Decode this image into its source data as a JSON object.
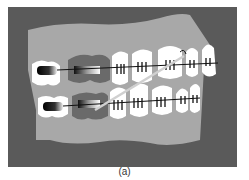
{
  "figure": {
    "caption": "(a)",
    "colors": {
      "background": "#5a5a5a",
      "gum": "#a8a8a8",
      "tooth": "#ffffff",
      "wire": "#111111",
      "elastic": "#d8d8d8",
      "band": "#666666"
    }
  }
}
